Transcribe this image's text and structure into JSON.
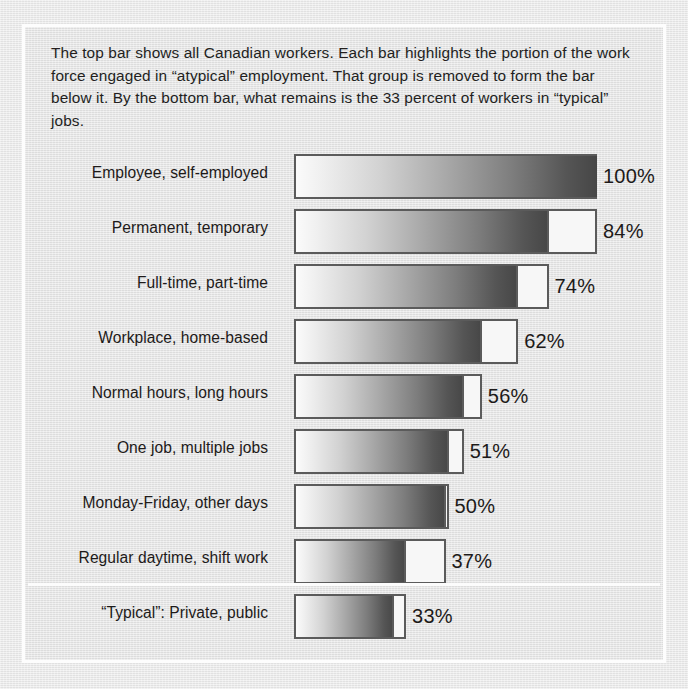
{
  "caption": {
    "text": "The top bar shows all Canadian workers.  Each bar highlights the portion of the work force engaged in “atypical” employment.  That group is removed to form the bar below it.  By the bottom bar, what remains is the 33 percent of workers in “typical” jobs."
  },
  "colors": {
    "page_background": "#e9e9e9",
    "frame_border": "#fdfdfd",
    "bar_outline": "#5b5b5b",
    "bar_gradient_start": "#fbfbfb",
    "bar_gradient_end": "#464646",
    "removed_segment": "#f7f7f7",
    "text": "#1d1a19"
  },
  "chart_data": {
    "type": "bar",
    "title": "",
    "subtitle": "",
    "xlabel": "",
    "ylabel": "",
    "xlim": [
      0,
      100
    ],
    "grid": false,
    "legend": null,
    "orientation": "horizontal",
    "note": "Each bar's total length equals the previous bar's percent; the shaded portion is the percent remaining after the atypical group is removed, and the white tail is the removed group.",
    "categories": [
      "Employee, self-employed",
      "Permanent, temporary",
      "Full-time, part-time",
      "Workplace, home-based",
      "Normal hours, long hours",
      "One job, multiple jobs",
      "Monday-Friday, other days",
      "Regular daytime, shift work",
      "“Typical”: Private, public"
    ],
    "values": [
      100,
      84,
      74,
      62,
      56,
      51,
      50,
      37,
      33
    ],
    "value_labels": [
      "100%",
      "84%",
      "74%",
      "62%",
      "56%",
      "51%",
      "50%",
      "37%",
      "33%"
    ],
    "bar_total_extent": [
      100,
      100,
      84,
      74,
      62,
      56,
      51,
      50,
      37
    ],
    "removed_percent": [
      0,
      16,
      10,
      12,
      6,
      5,
      1,
      13,
      4
    ],
    "series": [
      {
        "name": "Remaining work force",
        "values": [
          100,
          84,
          74,
          62,
          56,
          51,
          50,
          37,
          33
        ]
      },
      {
        "name": "Atypical group removed",
        "values": [
          0,
          16,
          10,
          12,
          6,
          5,
          1,
          13,
          4
        ]
      }
    ]
  },
  "rows": [
    {
      "label": "Employee, self-employed",
      "value_label": "100%",
      "total": 100,
      "fill": 100,
      "has_divider": false
    },
    {
      "label": "Permanent, temporary",
      "value_label": "84%",
      "total": 100,
      "fill": 84,
      "has_divider": true
    },
    {
      "label": "Full-time, part-time",
      "value_label": "74%",
      "total": 84,
      "fill": 74,
      "has_divider": true
    },
    {
      "label": "Workplace, home-based",
      "value_label": "62%",
      "total": 74,
      "fill": 62,
      "has_divider": true
    },
    {
      "label": "Normal hours, long hours",
      "value_label": "56%",
      "total": 62,
      "fill": 56,
      "has_divider": true
    },
    {
      "label": "One job, multiple jobs",
      "value_label": "51%",
      "total": 56,
      "fill": 51,
      "has_divider": true
    },
    {
      "label": "Monday-Friday, other days",
      "value_label": "50%",
      "total": 51,
      "fill": 50,
      "has_divider": true
    },
    {
      "label": "Regular daytime, shift work",
      "value_label": "37%",
      "total": 50,
      "fill": 37,
      "has_divider": true
    },
    {
      "label": "“Typical”: Private, public",
      "value_label": "33%",
      "total": 37,
      "fill": 33,
      "has_divider": true
    }
  ]
}
